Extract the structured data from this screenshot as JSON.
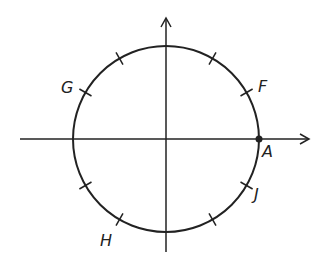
{
  "diagram": {
    "center": [
      166,
      139
    ],
    "radius": 93,
    "stroke_color": "#222222",
    "axes": {
      "x": {
        "from": 20,
        "to": 310,
        "y": 139
      },
      "y": {
        "from": 252,
        "to": 18,
        "x": 166
      }
    },
    "tick_angles_deg": [
      30,
      60,
      120,
      150,
      210,
      240,
      300,
      330
    ],
    "points": [
      {
        "label": "A",
        "angle_deg": 0,
        "dot": true,
        "label_pos": [
          267,
          157
        ]
      },
      {
        "label": "F",
        "angle_deg": 30,
        "dot": false,
        "label_pos": [
          260,
          92
        ]
      },
      {
        "label": "G",
        "angle_deg": 150,
        "dot": false,
        "label_pos": [
          62,
          92
        ]
      },
      {
        "label": "H",
        "angle_deg": 240,
        "dot": false,
        "label_pos": [
          100,
          246
        ]
      },
      {
        "label": "J",
        "angle_deg": 330,
        "dot": false,
        "label_pos": [
          256,
          200
        ]
      }
    ]
  }
}
